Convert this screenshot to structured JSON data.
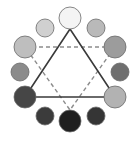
{
  "diagram": {
    "type": "color-wheel-triad",
    "background": "#ffffff",
    "stroke_color": "#3a3a3a",
    "dash_color": "#8c8c8c",
    "circles": [
      {
        "name": "top",
        "cx": 70,
        "cy": 18,
        "r": 11,
        "fill": "#f4f4f4"
      },
      {
        "name": "top-right",
        "cx": 96,
        "cy": 28,
        "r": 9,
        "fill": "#b9b9b9"
      },
      {
        "name": "right-upper",
        "cx": 115,
        "cy": 47,
        "r": 11,
        "fill": "#9c9c9c"
      },
      {
        "name": "right-mid",
        "cx": 120,
        "cy": 72,
        "r": 9,
        "fill": "#6f6f6f"
      },
      {
        "name": "right-lower",
        "cx": 115,
        "cy": 97,
        "r": 11,
        "fill": "#b2b2b2"
      },
      {
        "name": "bottom-right",
        "cx": 96,
        "cy": 116,
        "r": 9,
        "fill": "#353535"
      },
      {
        "name": "bottom",
        "cx": 70,
        "cy": 121,
        "r": 11,
        "fill": "#1f1f1f"
      },
      {
        "name": "bottom-left",
        "cx": 45,
        "cy": 116,
        "r": 9,
        "fill": "#3b3b3b"
      },
      {
        "name": "left-lower",
        "cx": 25,
        "cy": 97,
        "r": 11,
        "fill": "#464646"
      },
      {
        "name": "left-mid",
        "cx": 20,
        "cy": 72,
        "r": 9,
        "fill": "#8b8b8b"
      },
      {
        "name": "left-upper",
        "cx": 25,
        "cy": 47,
        "r": 11,
        "fill": "#bebebe"
      },
      {
        "name": "top-left",
        "cx": 45,
        "cy": 28,
        "r": 9,
        "fill": "#d0d0d0"
      }
    ],
    "solid_triangle": {
      "points": "70,29 25,97 115,97"
    },
    "dashed_triangle": {
      "points": "25,47 115,47 70,110"
    }
  }
}
